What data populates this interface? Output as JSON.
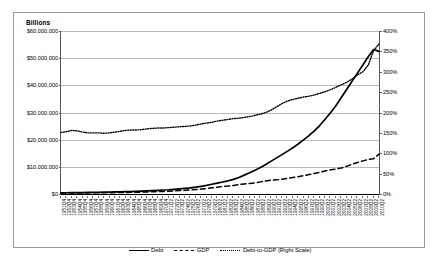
{
  "chart_data": {
    "type": "line",
    "title": "",
    "unit_label": "Billions",
    "ylabel": "",
    "xlabel": "",
    "ylim": [
      0,
      60000000
    ],
    "y_ticks": [
      "$0",
      "$10,000,000",
      "$20,000,000",
      "$30,000,000",
      "$40,000,000",
      "$50,000,000",
      "$60,000,000"
    ],
    "y_tick_values": [
      0,
      10000000,
      20000000,
      30000000,
      40000000,
      50000000,
      60000000
    ],
    "y2lim": [
      0,
      400
    ],
    "y2_ticks": [
      "0%",
      "50%",
      "100%",
      "150%",
      "200%",
      "250%",
      "300%",
      "350%",
      "400%"
    ],
    "y2_tick_values": [
      0,
      50,
      100,
      150,
      200,
      250,
      300,
      350,
      400
    ],
    "grid": true,
    "legend_position": "bottom",
    "categories": [
      "1951Q4",
      "1952Q4",
      "1953Q4",
      "1954Q4",
      "1955Q4",
      "1956Q4",
      "1957Q4",
      "1958Q4",
      "1959Q4",
      "1960Q4",
      "1961Q4",
      "1962Q4",
      "1963Q4",
      "1964Q4",
      "1965Q4",
      "1966Q4",
      "1967Q4",
      "1968Q4",
      "1969Q4",
      "1970Q4",
      "1971Q2",
      "1972Q2",
      "1973Q2",
      "1974Q2",
      "1975Q2",
      "1976Q2",
      "1977Q2",
      "1978Q2",
      "1979Q2",
      "1980Q2",
      "1981Q2",
      "1982Q2",
      "1983Q2",
      "1984Q2",
      "1985Q2",
      "1986Q2",
      "1987Q2",
      "1988Q2",
      "1989Q2",
      "1990Q2",
      "1991Q2",
      "1992Q2",
      "1993Q2",
      "1994Q2",
      "1995Q2",
      "1996Q2",
      "1997Q2",
      "1998Q2",
      "1999Q2",
      "2000Q2",
      "2001Q2",
      "2002Q2",
      "2003Q2",
      "2004Q2",
      "2005Q2",
      "2006Q2",
      "2007Q2",
      "2008Q2",
      "2009Q2",
      "2010Q2"
    ],
    "series": [
      {
        "name": "Debt",
        "style": "solid",
        "axis": "left",
        "values": [
          430000,
          455000,
          480000,
          505000,
          535000,
          565000,
          595000,
          630000,
          670000,
          710000,
          755000,
          805000,
          860000,
          920000,
          985000,
          1060000,
          1145000,
          1245000,
          1360000,
          1470000,
          1560000,
          1700000,
          1880000,
          2070000,
          2260000,
          2520000,
          2830000,
          3180000,
          3580000,
          3980000,
          4420000,
          4860000,
          5400000,
          6100000,
          6950000,
          7850000,
          8750000,
          9750000,
          10900000,
          12100000,
          13300000,
          14500000,
          15700000,
          17000000,
          18400000,
          19900000,
          21500000,
          23200000,
          25200000,
          27500000,
          29900000,
          32500000,
          35500000,
          38500000,
          41500000,
          44500000,
          47500000,
          50500000,
          53200000,
          52500000
        ]
      },
      {
        "name": "GDP",
        "style": "dashed",
        "axis": "left",
        "values": [
          330000,
          345000,
          355000,
          365000,
          390000,
          410000,
          430000,
          440000,
          470000,
          490000,
          505000,
          540000,
          565000,
          605000,
          650000,
          710000,
          750000,
          820000,
          890000,
          950000,
          1020000,
          1120000,
          1250000,
          1350000,
          1470000,
          1630000,
          1810000,
          2020000,
          2260000,
          2470000,
          2780000,
          2910000,
          3110000,
          3450000,
          3700000,
          3900000,
          4130000,
          4460000,
          4790000,
          5070000,
          5200000,
          5460000,
          5720000,
          6060000,
          6380000,
          6760000,
          7170000,
          7550000,
          8000000,
          8500000,
          8900000,
          9200000,
          9600000,
          10200000,
          10900000,
          11600000,
          12200000,
          12700000,
          13000000,
          14700000
        ]
      },
      {
        "name": "Debt-to-GDP (Right Scale)",
        "style": "dotted",
        "axis": "right",
        "values": [
          151,
          153,
          156,
          155,
          152,
          150,
          150,
          150,
          149,
          150,
          152,
          154,
          156,
          157,
          157,
          158,
          160,
          161,
          162,
          162,
          163,
          164,
          165,
          166,
          167,
          169,
          172,
          174,
          176,
          179,
          181,
          183,
          185,
          186,
          188,
          190,
          193,
          196,
          200,
          206,
          214,
          222,
          228,
          232,
          235,
          238,
          240,
          243,
          247,
          251,
          256,
          262,
          268,
          274,
          282,
          292,
          300,
          316,
          352,
          368
        ]
      }
    ],
    "legend": [
      {
        "label": "Debt",
        "style": "solid"
      },
      {
        "label": "GDP",
        "style": "dashed"
      },
      {
        "label": "Debt-to-GDP (Right Scale)",
        "style": "dotted"
      }
    ]
  }
}
